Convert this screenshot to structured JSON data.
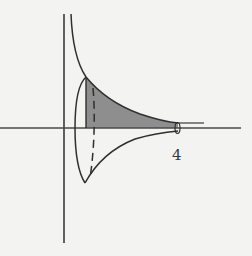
{
  "diagram": {
    "labels": {
      "x_tick": "4"
    },
    "colors": {
      "background": "#f3f3f1",
      "stroke": "#2f2f2f",
      "shading": "#8e8e8e",
      "axis": "#4a4a4a"
    },
    "elements": [
      "y-axis",
      "x-axis",
      "upper-curve",
      "lower-curve",
      "shaded-region",
      "left-cross-section-ellipse",
      "left-cross-section-dashed",
      "right-cross-section-ellipse",
      "vertical-bound-line"
    ]
  }
}
